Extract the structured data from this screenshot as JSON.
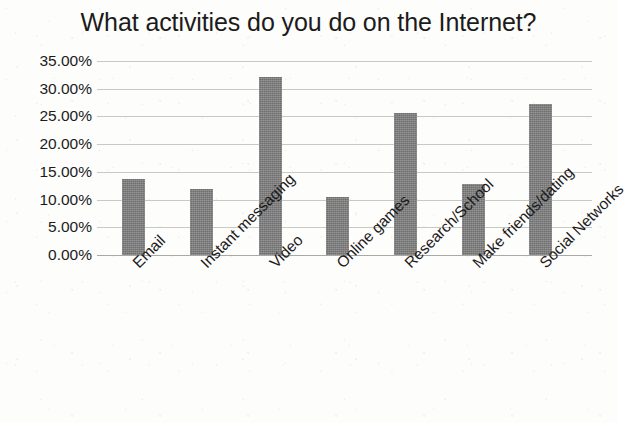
{
  "chart_data": {
    "type": "bar",
    "title": "What activities do you do on the Internet?",
    "xlabel": "",
    "ylabel": "",
    "categories": [
      "Email",
      "Instant messaging",
      "Video",
      "Online games",
      "Research/School",
      "Make friends/dating",
      "Social Networks"
    ],
    "values": [
      13.8,
      11.9,
      32.2,
      10.5,
      25.7,
      12.8,
      27.3
    ],
    "value_labels": [
      "13.80%",
      "11.90%",
      "32.20%",
      "10.50%",
      "25.70%",
      "12.80%",
      "27.30%"
    ],
    "ylim": [
      0,
      35
    ],
    "ytick_values": [
      35,
      30,
      25,
      20,
      15,
      10,
      5,
      0
    ],
    "ytick_labels": [
      "35.00%",
      "30.00%",
      "25.00%",
      "20.00%",
      "15.00%",
      "10.00%",
      "5.00%",
      "0.00%"
    ],
    "grid": true,
    "legend": false,
    "legend_position": "none",
    "series_name": "Activities",
    "bar_color": "#7e7e7e",
    "gridline_color": "#c9c9c4",
    "text_color": "#1c1b1b",
    "background_color": "#fdfdfc",
    "x_label_rotation": -45
  }
}
